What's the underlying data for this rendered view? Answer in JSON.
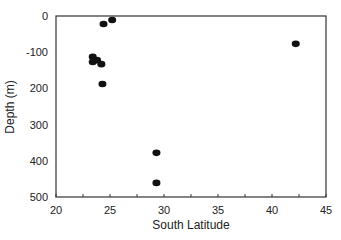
{
  "chart_data": {
    "type": "scatter",
    "title": "",
    "xlabel": "South Latitude",
    "ylabel": "Depth (m)",
    "xlim": [
      20,
      45
    ],
    "ylim": [
      500,
      0
    ],
    "x_ticks": [
      20,
      25,
      30,
      35,
      40,
      45
    ],
    "x_tick_labels": [
      "20",
      "25",
      "30",
      "35",
      "40",
      "45"
    ],
    "y_ticks": [
      0,
      100,
      200,
      300,
      400,
      500
    ],
    "y_tick_labels": [
      "0",
      "-100",
      "200",
      "300",
      "400",
      "500"
    ],
    "grid": false,
    "legend": null,
    "series": [
      {
        "name": "samples",
        "marker": "filled-ellipse",
        "color": "#111111",
        "points": [
          {
            "x": 25.2,
            "y": 11
          },
          {
            "x": 24.4,
            "y": 22
          },
          {
            "x": 23.4,
            "y": 113
          },
          {
            "x": 23.8,
            "y": 122
          },
          {
            "x": 23.4,
            "y": 127
          },
          {
            "x": 24.2,
            "y": 133
          },
          {
            "x": 24.3,
            "y": 188
          },
          {
            "x": 29.3,
            "y": 378
          },
          {
            "x": 29.3,
            "y": 461
          },
          {
            "x": 42.2,
            "y": 77
          }
        ]
      }
    ]
  }
}
